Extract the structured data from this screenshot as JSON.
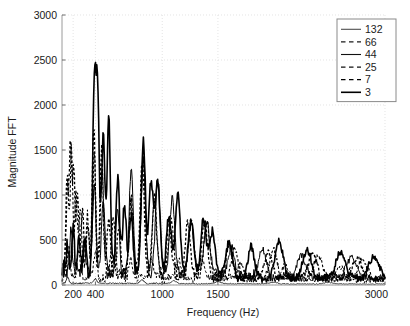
{
  "chart_data": {
    "type": "line",
    "title": "",
    "xlabel": "Frequency (Hz)",
    "ylabel": "Magnitude FFT",
    "xlim": [
      100,
      3000
    ],
    "ylim": [
      0,
      3000
    ],
    "xticks": [
      200,
      400,
      1000,
      1500,
      3000
    ],
    "xtick_labels": [
      "200",
      "400",
      "1000",
      "1500",
      "3000"
    ],
    "yticks": [
      0,
      500,
      1000,
      1500,
      2000,
      2500,
      3000
    ],
    "ytick_labels": [
      "0",
      "500",
      "1000",
      "1500",
      "2000",
      "2500",
      "3000"
    ],
    "grid": true,
    "legend_position": "upper right",
    "legend_title": "",
    "series": [
      {
        "name": "132",
        "label": "132",
        "style": "solid",
        "width": 0.8,
        "color": "#4d4d4d",
        "seed": 11,
        "peaks": [
          {
            "f": 150,
            "a": 60
          },
          {
            "f": 400,
            "a": 45
          },
          {
            "f": 820,
            "a": 35
          },
          {
            "f": 1100,
            "a": 30
          },
          {
            "f": 1500,
            "a": 25
          },
          {
            "f": 2000,
            "a": 20
          },
          {
            "f": 2500,
            "a": 18
          }
        ],
        "floor": 22,
        "noise": 14,
        "decay": 1400,
        "comment": "lowest trace, hugs the zero baseline across entire range"
      },
      {
        "name": "66",
        "label": "66",
        "style": "dashed",
        "width": 1.0,
        "color": "#1a1a1a",
        "seed": 23,
        "peaks": [
          {
            "f": 160,
            "a": 380
          },
          {
            "f": 250,
            "a": 300
          },
          {
            "f": 400,
            "a": 260
          },
          {
            "f": 560,
            "a": 220
          },
          {
            "f": 720,
            "a": 200
          },
          {
            "f": 900,
            "a": 180
          },
          {
            "f": 1150,
            "a": 200
          },
          {
            "f": 1350,
            "a": 210
          },
          {
            "f": 1700,
            "a": 170
          },
          {
            "f": 2100,
            "a": 150
          },
          {
            "f": 2600,
            "a": 130
          }
        ],
        "floor": 95,
        "noise": 80,
        "decay": 2600
      },
      {
        "name": "44",
        "label": "44",
        "style": "solid",
        "width": 1.0,
        "color": "#111111",
        "seed": 37,
        "peaks": [
          {
            "f": 180,
            "a": 420
          },
          {
            "f": 300,
            "a": 330
          },
          {
            "f": 390,
            "a": 1020
          },
          {
            "f": 470,
            "a": 820
          },
          {
            "f": 600,
            "a": 700
          },
          {
            "f": 720,
            "a": 1150
          },
          {
            "f": 830,
            "a": 1290
          },
          {
            "f": 960,
            "a": 1040
          },
          {
            "f": 1090,
            "a": 880
          },
          {
            "f": 1260,
            "a": 560
          },
          {
            "f": 1400,
            "a": 600
          },
          {
            "f": 1620,
            "a": 330
          },
          {
            "f": 1900,
            "a": 300
          },
          {
            "f": 2250,
            "a": 260
          },
          {
            "f": 2700,
            "a": 240
          }
        ],
        "floor": 150,
        "noise": 110,
        "decay": 2200
      },
      {
        "name": "25",
        "label": "25",
        "style": "dashed",
        "width": 1.1,
        "color": "#111111",
        "seed": 53,
        "peaks": [
          {
            "f": 150,
            "a": 1040
          },
          {
            "f": 185,
            "a": 1360
          },
          {
            "f": 225,
            "a": 860
          },
          {
            "f": 265,
            "a": 700
          },
          {
            "f": 330,
            "a": 620
          },
          {
            "f": 390,
            "a": 1290
          },
          {
            "f": 460,
            "a": 1180
          },
          {
            "f": 560,
            "a": 640
          },
          {
            "f": 720,
            "a": 820
          },
          {
            "f": 830,
            "a": 1250
          },
          {
            "f": 930,
            "a": 900
          },
          {
            "f": 1080,
            "a": 620
          },
          {
            "f": 1260,
            "a": 640
          },
          {
            "f": 1400,
            "a": 580
          },
          {
            "f": 1650,
            "a": 330
          },
          {
            "f": 2000,
            "a": 290
          },
          {
            "f": 2400,
            "a": 250
          },
          {
            "f": 2800,
            "a": 220
          }
        ],
        "floor": 140,
        "noise": 120,
        "decay": 1500
      },
      {
        "name": "7",
        "label": "7",
        "style": "dashed",
        "width": 1.3,
        "color": "#000000",
        "seed": 71,
        "peaks": [
          {
            "f": 145,
            "a": 1010
          },
          {
            "f": 175,
            "a": 1355
          },
          {
            "f": 205,
            "a": 1100
          },
          {
            "f": 240,
            "a": 830
          },
          {
            "f": 285,
            "a": 700
          },
          {
            "f": 330,
            "a": 560
          },
          {
            "f": 385,
            "a": 1600
          },
          {
            "f": 455,
            "a": 1390
          },
          {
            "f": 520,
            "a": 640
          },
          {
            "f": 610,
            "a": 520
          },
          {
            "f": 720,
            "a": 830
          },
          {
            "f": 820,
            "a": 1260
          },
          {
            "f": 930,
            "a": 780
          },
          {
            "f": 1060,
            "a": 560
          },
          {
            "f": 1230,
            "a": 560
          },
          {
            "f": 1380,
            "a": 610
          },
          {
            "f": 1600,
            "a": 360
          },
          {
            "f": 1950,
            "a": 300
          },
          {
            "f": 2350,
            "a": 270
          },
          {
            "f": 2750,
            "a": 240
          }
        ],
        "floor": 150,
        "noise": 130,
        "decay": 1300
      },
      {
        "name": "3",
        "label": "3",
        "style": "solid",
        "width": 1.6,
        "color": "#000000",
        "seed": 97,
        "peaks": [
          {
            "f": 150,
            "a": 330
          },
          {
            "f": 200,
            "a": 500
          },
          {
            "f": 255,
            "a": 420
          },
          {
            "f": 310,
            "a": 360
          },
          {
            "f": 390,
            "a": 2050
          },
          {
            "f": 420,
            "a": 1930
          },
          {
            "f": 470,
            "a": 1490
          },
          {
            "f": 520,
            "a": 1670
          },
          {
            "f": 600,
            "a": 1070
          },
          {
            "f": 660,
            "a": 760
          },
          {
            "f": 720,
            "a": 640
          },
          {
            "f": 830,
            "a": 1510
          },
          {
            "f": 900,
            "a": 1020
          },
          {
            "f": 960,
            "a": 1040
          },
          {
            "f": 1060,
            "a": 700
          },
          {
            "f": 1140,
            "a": 880
          },
          {
            "f": 1260,
            "a": 600
          },
          {
            "f": 1370,
            "a": 600
          },
          {
            "f": 1450,
            "a": 470
          },
          {
            "f": 1600,
            "a": 380
          },
          {
            "f": 1800,
            "a": 330
          },
          {
            "f": 2050,
            "a": 400
          },
          {
            "f": 2300,
            "a": 300
          },
          {
            "f": 2600,
            "a": 290
          },
          {
            "f": 2900,
            "a": 250
          }
        ],
        "floor": 160,
        "noise": 140,
        "decay": 1250
      }
    ],
    "annotations": [],
    "max_observed_magnitude": 2050,
    "max_observed_frequency": 390
  },
  "axes": {
    "background": "#ffffff",
    "frame_color": "#9a9a9a",
    "grid_color": "#d8d8d8"
  },
  "legend": {
    "entries": [
      "132",
      "66",
      "44",
      "25",
      "7",
      "3"
    ]
  }
}
